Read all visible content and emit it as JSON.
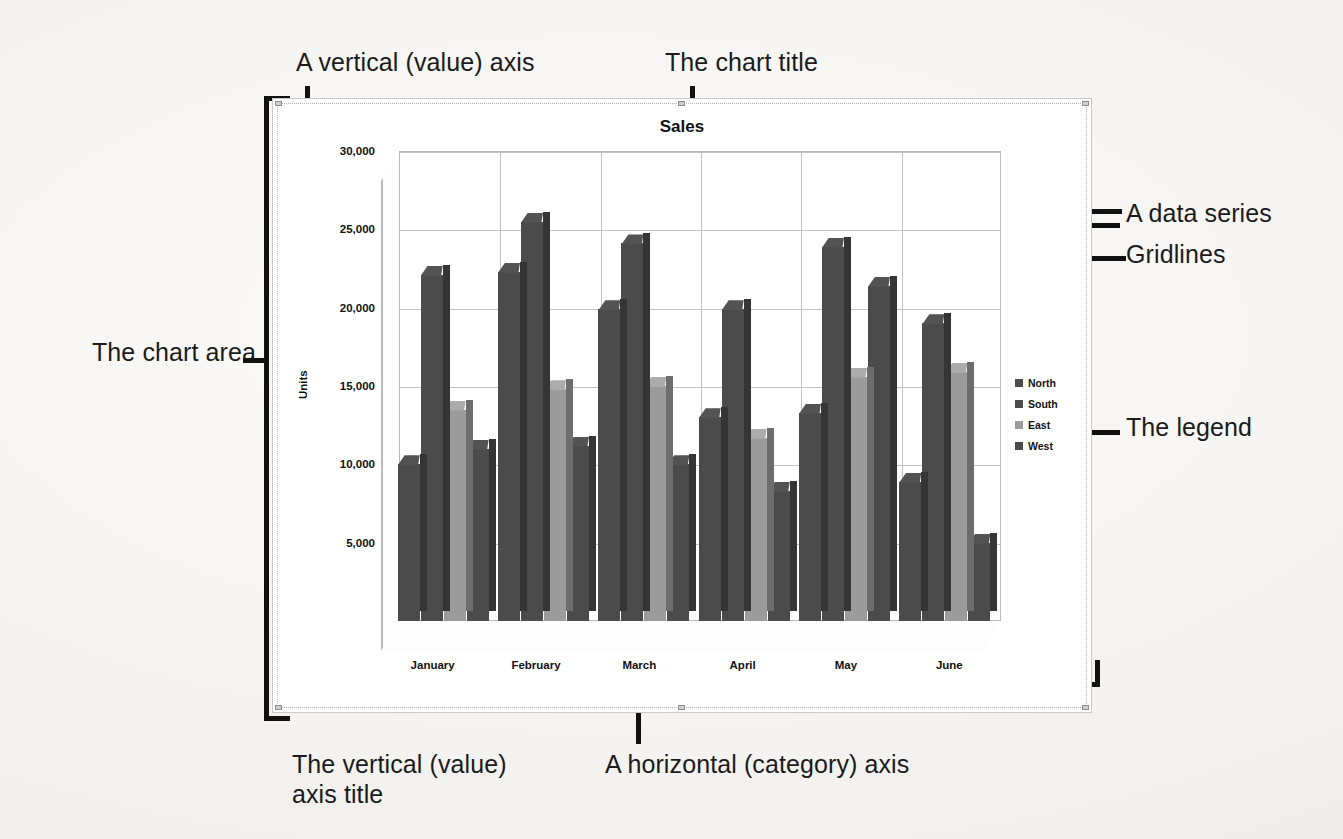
{
  "annotations": {
    "chart_area": "The chart area",
    "vertical_value_axis": "A vertical (value) axis",
    "chart_title": "The chart title",
    "data_series": "A data series",
    "gridlines": "Gridlines",
    "legend": "The legend",
    "vertical_axis_title": "The vertical (value)\naxis title",
    "horizontal_category_axis": "A horizontal (category) axis"
  },
  "chart_data": {
    "type": "bar",
    "title": "Sales",
    "xlabel": "",
    "ylabel": "Units",
    "ylim": [
      0,
      30000
    ],
    "yticks": [
      5000,
      10000,
      15000,
      20000,
      25000,
      30000
    ],
    "ytick_labels": [
      "5,000",
      "10,000",
      "15,000",
      "20,000",
      "25,000",
      "30,000"
    ],
    "grid": true,
    "legend_position": "right",
    "categories": [
      "January",
      "February",
      "March",
      "April",
      "May",
      "June"
    ],
    "series": [
      {
        "name": "North",
        "color": "#4b4b4b",
        "values": [
          10000,
          22300,
          19900,
          13000,
          13300,
          8900
        ]
      },
      {
        "name": "South",
        "color": "#4b4b4b",
        "values": [
          22100,
          25500,
          24100,
          19900,
          23900,
          19000
        ]
      },
      {
        "name": "East",
        "color": "#9b9b9b",
        "values": [
          13500,
          14800,
          15000,
          11700,
          15600,
          15900
        ]
      },
      {
        "name": "West",
        "color": "#4b4b4b",
        "values": [
          11000,
          11200,
          10000,
          8300,
          21400,
          5000
        ]
      }
    ]
  }
}
